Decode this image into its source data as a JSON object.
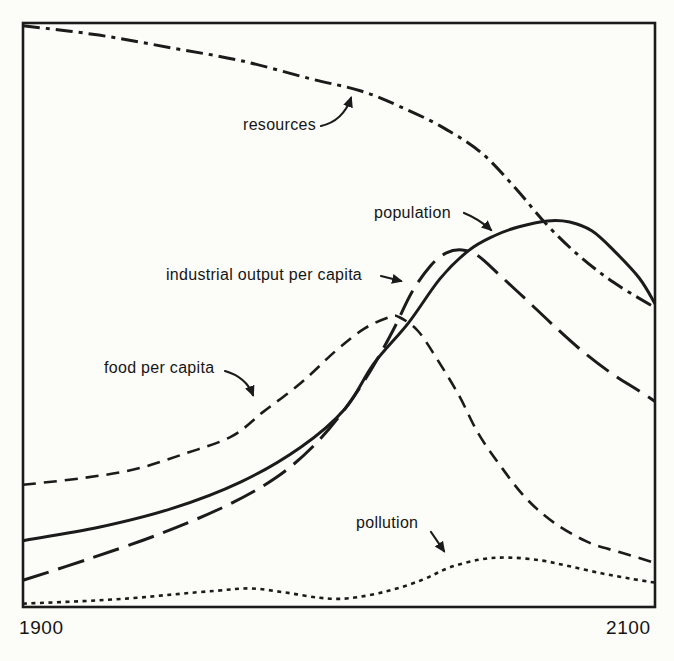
{
  "figure": {
    "ink_color": "#1b1b1b",
    "paper_color": "#fcfcf9"
  },
  "chart_data": {
    "type": "line",
    "title": "",
    "xlabel": "",
    "ylabel": "",
    "x_range": [
      1900,
      2100
    ],
    "y_range": [
      0,
      1
    ],
    "x_ticks": [
      "1900",
      "2100"
    ],
    "grid": false,
    "legend_position": "inline-annotations",
    "series": [
      {
        "name": "resources",
        "line_style": "dash-dot",
        "points": [
          [
            1900,
            0.997
          ],
          [
            1924,
            0.981
          ],
          [
            1947,
            0.959
          ],
          [
            1969,
            0.937
          ],
          [
            1991,
            0.906
          ],
          [
            2007,
            0.885
          ],
          [
            2019,
            0.859
          ],
          [
            2032,
            0.825
          ],
          [
            2045,
            0.779
          ],
          [
            2056,
            0.717
          ],
          [
            2066,
            0.654
          ],
          [
            2076,
            0.602
          ],
          [
            2087,
            0.556
          ],
          [
            2100,
            0.513
          ]
        ]
      },
      {
        "name": "population",
        "line_style": "solid",
        "points": [
          [
            1900,
            0.113
          ],
          [
            1924,
            0.136
          ],
          [
            1947,
            0.168
          ],
          [
            1969,
            0.214
          ],
          [
            1988,
            0.274
          ],
          [
            2002,
            0.34
          ],
          [
            2011,
            0.417
          ],
          [
            2022,
            0.487
          ],
          [
            2032,
            0.563
          ],
          [
            2041,
            0.611
          ],
          [
            2049,
            0.636
          ],
          [
            2057,
            0.652
          ],
          [
            2066,
            0.662
          ],
          [
            2073,
            0.66
          ],
          [
            2080,
            0.645
          ],
          [
            2087,
            0.611
          ],
          [
            2095,
            0.564
          ],
          [
            2100,
            0.52
          ]
        ]
      },
      {
        "name": "industrial output per capita",
        "line_style": "long-dash",
        "points": [
          [
            1900,
            0.045
          ],
          [
            1921,
            0.082
          ],
          [
            1943,
            0.124
          ],
          [
            1964,
            0.172
          ],
          [
            1980,
            0.221
          ],
          [
            1992,
            0.276
          ],
          [
            2002,
            0.34
          ],
          [
            2010,
            0.405
          ],
          [
            2017,
            0.473
          ],
          [
            2023,
            0.539
          ],
          [
            2029,
            0.585
          ],
          [
            2034,
            0.607
          ],
          [
            2039,
            0.612
          ],
          [
            2044,
            0.602
          ],
          [
            2051,
            0.568
          ],
          [
            2059,
            0.528
          ],
          [
            2067,
            0.487
          ],
          [
            2076,
            0.443
          ],
          [
            2086,
            0.401
          ],
          [
            2095,
            0.37
          ],
          [
            2100,
            0.352
          ]
        ]
      },
      {
        "name": "food per capita",
        "line_style": "dash",
        "points": [
          [
            1900,
            0.209
          ],
          [
            1918,
            0.22
          ],
          [
            1935,
            0.235
          ],
          [
            1951,
            0.262
          ],
          [
            1966,
            0.292
          ],
          [
            1976,
            0.334
          ],
          [
            1988,
            0.384
          ],
          [
            1999,
            0.439
          ],
          [
            2008,
            0.477
          ],
          [
            2016,
            0.497
          ],
          [
            2019,
            0.497
          ],
          [
            2025,
            0.473
          ],
          [
            2031,
            0.425
          ],
          [
            2038,
            0.362
          ],
          [
            2044,
            0.298
          ],
          [
            2051,
            0.242
          ],
          [
            2059,
            0.187
          ],
          [
            2068,
            0.144
          ],
          [
            2079,
            0.11
          ],
          [
            2089,
            0.093
          ],
          [
            2100,
            0.075
          ]
        ]
      },
      {
        "name": "pollution",
        "line_style": "dotted",
        "points": [
          [
            1900,
            0.005
          ],
          [
            1918,
            0.009
          ],
          [
            1934,
            0.014
          ],
          [
            1948,
            0.021
          ],
          [
            1961,
            0.027
          ],
          [
            1972,
            0.031
          ],
          [
            1983,
            0.024
          ],
          [
            1994,
            0.015
          ],
          [
            2003,
            0.014
          ],
          [
            2015,
            0.026
          ],
          [
            2026,
            0.045
          ],
          [
            2035,
            0.067
          ],
          [
            2045,
            0.081
          ],
          [
            2054,
            0.084
          ],
          [
            2064,
            0.079
          ],
          [
            2073,
            0.069
          ],
          [
            2083,
            0.057
          ],
          [
            2092,
            0.048
          ],
          [
            2100,
            0.041
          ]
        ]
      }
    ],
    "annotations": [
      {
        "id": "resources",
        "text": "resources",
        "label_px": [
          316,
          130
        ],
        "anchor": "end",
        "arrow": "M 321 126 Q 343 121 351 98"
      },
      {
        "id": "population",
        "text": "population",
        "label_px": [
          374,
          218
        ],
        "anchor": "start",
        "arrow": "M 464 213 Q 479 219 491 230"
      },
      {
        "id": "industrial-output",
        "text": "industrial output per capita",
        "label_px": [
          166,
          280
        ],
        "anchor": "start",
        "arrow": "M 381 276 L 401 281"
      },
      {
        "id": "food-per-capita",
        "text": "food per capita",
        "label_px": [
          104,
          373
        ],
        "anchor": "start",
        "arrow": "M 225 371 Q 246 377 253 395"
      },
      {
        "id": "pollution",
        "text": "pollution",
        "label_px": [
          356,
          528
        ],
        "anchor": "start",
        "arrow": "M 431 532 L 444 551"
      }
    ]
  }
}
